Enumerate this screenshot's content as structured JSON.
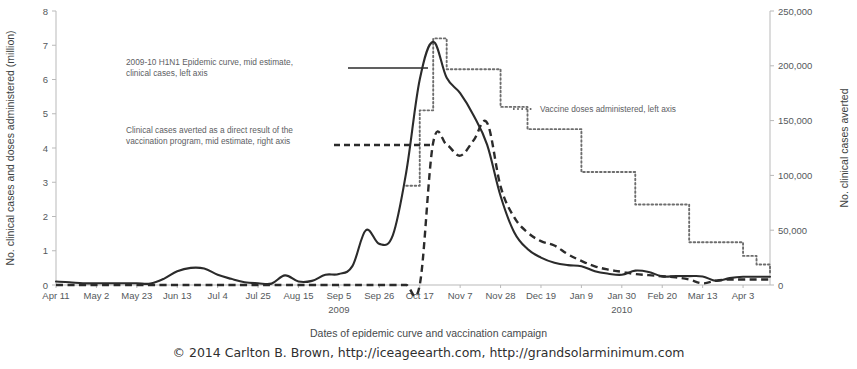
{
  "figure": {
    "xaxis_title": "Dates of epidemic curve and vaccination campaign",
    "copyright": "© 2014 Carlton B. Brown, http://iceageearth.com, http://grandsolarminimum.com"
  },
  "annotations": {
    "epidemic": {
      "line1": "2009-10 H1N1 Epidemic curve, mid estimate,",
      "line2": "clinical cases, left axis"
    },
    "averted": {
      "line1": "Clinical cases averted as a direct result of the",
      "line2": "vaccination program, mid estimate, right axis"
    },
    "vaccine": {
      "line1": "Vaccine doses administered, left axis"
    }
  },
  "chart_data": {
    "type": "line",
    "title": "",
    "xlabel": "Dates of epidemic curve and vaccination campaign",
    "ylabel": "No. clinical cases and doses administered (million)",
    "y2label": "No. clinical cases averted",
    "ylim": [
      0,
      8
    ],
    "y2lim": [
      0,
      250000
    ],
    "yticks": [
      "0",
      "1",
      "2",
      "3",
      "4",
      "5",
      "6",
      "7",
      "8"
    ],
    "y2ticks": [
      "0",
      "50,000",
      "100,000",
      "150,000",
      "200,000",
      "250,000"
    ],
    "grid": false,
    "legend_position": "inline-annotations",
    "year_labels": [
      {
        "text": "2009",
        "x_category": "Sep 5"
      },
      {
        "text": "2010",
        "x_category": "Jan 30"
      }
    ],
    "categories": [
      "Apr 11",
      "Apr 18",
      "Apr 25",
      "May 2",
      "May 9",
      "May 16",
      "May 23",
      "May 30",
      "Jun 6",
      "Jun 13",
      "Jun 20",
      "Jun 27",
      "Jul 4",
      "Jul 11",
      "Jul 18",
      "Jul 25",
      "Aug 1",
      "Aug 8",
      "Aug 15",
      "Aug 22",
      "Aug 29",
      "Sep 5",
      "Sep 12",
      "Sep 19",
      "Sep 26",
      "Oct 3",
      "Oct 10",
      "Oct 17",
      "Oct 24",
      "Oct 31",
      "Nov 7",
      "Nov 14",
      "Nov 21",
      "Nov 28",
      "Dec 5",
      "Dec 12",
      "Dec 19",
      "Dec 26",
      "Jan 2",
      "Jan 9",
      "Jan 16",
      "Jan 23",
      "Jan 30",
      "Feb 6",
      "Feb 13",
      "Feb 20",
      "Feb 27",
      "Mar 6",
      "Mar 13",
      "Mar 20",
      "Mar 27",
      "Apr 3",
      "Apr 10",
      "Apr 17"
    ],
    "tick_categories": [
      "Apr 11",
      "May 2",
      "May 23",
      "Jun 13",
      "Jul 4",
      "Jul 25",
      "Aug 15",
      "Sep 5",
      "Sep 26",
      "Oct 17",
      "Nov 7",
      "Nov 28",
      "Dec 19",
      "Jan 9",
      "Jan 30",
      "Feb 20",
      "Mar 13",
      "Apr 3"
    ],
    "series": [
      {
        "name": "2009-10 H1N1 Epidemic curve, mid estimate, clinical cases, left axis",
        "style": "solid",
        "axis": "left",
        "units": "million clinical cases",
        "values": [
          0.1,
          0.08,
          0.05,
          0.05,
          0.05,
          0.05,
          0.05,
          0.04,
          0.18,
          0.4,
          0.5,
          0.48,
          0.3,
          0.18,
          0.08,
          0.05,
          0.04,
          0.28,
          0.1,
          0.12,
          0.3,
          0.32,
          0.55,
          1.6,
          1.2,
          1.45,
          3.3,
          6.0,
          7.1,
          6.05,
          5.6,
          4.95,
          4.1,
          2.6,
          1.55,
          1.05,
          0.8,
          0.65,
          0.58,
          0.55,
          0.4,
          0.33,
          0.3,
          0.42,
          0.38,
          0.25,
          0.26,
          0.26,
          0.25,
          0.12,
          0.2,
          0.24,
          0.24,
          0.24
        ]
      },
      {
        "name": "Clinical cases averted as a direct result of the vaccination program, mid estimate, right axis",
        "style": "dashed",
        "axis": "right",
        "units": "clinical cases averted",
        "values": [
          0,
          0,
          0,
          0,
          0,
          0,
          0,
          0,
          0,
          0,
          0,
          0,
          0,
          0,
          0,
          0,
          0,
          0,
          0,
          0,
          0,
          0,
          0,
          0,
          0,
          0,
          0,
          0,
          130000,
          128000,
          118000,
          132000,
          148000,
          90000,
          62000,
          48000,
          40000,
          36000,
          28000,
          22000,
          17000,
          14000,
          12000,
          10000,
          9000,
          8000,
          7000,
          5000,
          1500,
          4000,
          5000,
          5000,
          5000,
          5000
        ]
      },
      {
        "name": "Vaccine doses administered, left axis",
        "style": "dotted",
        "axis": "left",
        "units": "million doses",
        "values": [
          null,
          null,
          null,
          null,
          null,
          null,
          null,
          null,
          null,
          null,
          null,
          null,
          null,
          null,
          null,
          null,
          null,
          null,
          null,
          null,
          null,
          null,
          null,
          null,
          null,
          null,
          2.9,
          5.1,
          7.2,
          6.3,
          6.3,
          6.3,
          6.3,
          5.2,
          5.2,
          4.55,
          4.55,
          4.55,
          4.55,
          3.3,
          3.3,
          3.3,
          3.3,
          2.35,
          2.35,
          2.35,
          2.35,
          1.25,
          1.25,
          1.25,
          1.25,
          0.85,
          0.6,
          0.3
        ]
      }
    ]
  }
}
